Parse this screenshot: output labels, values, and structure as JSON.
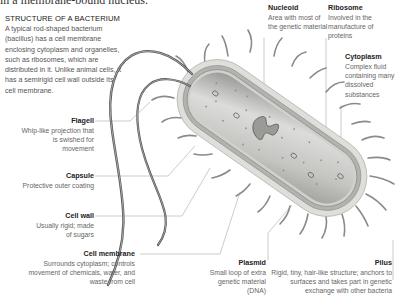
{
  "header": {
    "cut_text": "in a membrane-bound nucleus.",
    "title": "STRUCTURE OF A BACTERIUM",
    "intro": "A typical rod-shaped bacterium (bacillus) has a cell membrane enclosing cytoplasm and organelles, such as ribosomes, which are distributed in it. Unlike animal cells, it has a semirigid cell wall outside its cell membrane."
  },
  "labels": {
    "flagell": {
      "title": "Flagell",
      "desc": "Whip-like projection that is swished for movement"
    },
    "capsule": {
      "title": "Capsule",
      "desc": "Protective outer coating"
    },
    "cell_wall": {
      "title": "Cell wall",
      "desc": "Usually rigid; made of sugars"
    },
    "cell_membrane": {
      "title": "Cell membrane",
      "desc": "Surrounds cytoplasm; controls movement of chemicals, water, and waste from cell"
    },
    "nucleoid": {
      "title": "Nucleoid",
      "desc": "Area with most of the genetic material"
    },
    "ribosome": {
      "title": "Ribosome",
      "desc": "Involved in the manufacture of proteins"
    },
    "cytoplasm": {
      "title": "Cytoplasm",
      "desc": "Complex fluid containing many dissolved substances"
    },
    "plasmid": {
      "title": "Plasmid",
      "desc": "Small loop of extra genetic material (DNA)"
    },
    "pilus": {
      "title": "Pilus",
      "desc": "Rigid, tiny, hair-like structure; anchors to surfaces and takes part in genetic exchange with other bacteria"
    }
  },
  "colors": {
    "capsule": "#d9d9d6",
    "wall": "#a9a9a6",
    "cytoplasm": "#c8c8c5",
    "lines": "#9a9a9a",
    "text_title": "#222222",
    "text_body": "#666666"
  }
}
